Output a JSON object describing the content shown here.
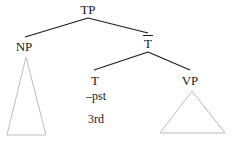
{
  "diagram": {
    "type": "syntax-tree",
    "title": "",
    "background_color": "#ffffff",
    "branch_color": "#1a1a1a",
    "triangle_color": "#b0b0b0",
    "text_color": "#1a1a1a"
  },
  "nodes": {
    "tp": {
      "label": "TP",
      "x": 88,
      "y": 3
    },
    "np": {
      "label": "NP",
      "x": 24,
      "y": 40
    },
    "tbar": {
      "label": "T",
      "x": 148,
      "y": 36
    },
    "t": {
      "label": "T",
      "x": 95,
      "y": 74
    },
    "vp": {
      "label": "VP",
      "x": 190,
      "y": 74
    }
  },
  "features": {
    "tense": {
      "label": "–pst",
      "x": 96,
      "y": 90
    },
    "person": {
      "label": "3rd",
      "x": 96,
      "y": 113
    }
  },
  "triangles": {
    "np_triangle": {
      "apex_x": 26,
      "apex_y": 57,
      "left_x": 7,
      "right_x": 46,
      "base_y": 135
    },
    "vp_triangle": {
      "apex_x": 192,
      "apex_y": 91,
      "left_x": 160,
      "right_x": 225,
      "base_y": 133
    }
  },
  "branches": {
    "tp_to_np": {
      "x1": 88,
      "y1": 18,
      "x2": 25,
      "y2": 37
    },
    "tp_to_tbar": {
      "x1": 88,
      "y1": 18,
      "x2": 148,
      "y2": 33
    },
    "tbar_to_t": {
      "x1": 148,
      "y1": 52,
      "x2": 94,
      "y2": 70
    },
    "tbar_to_vp": {
      "x1": 148,
      "y1": 52,
      "x2": 190,
      "y2": 70
    }
  }
}
